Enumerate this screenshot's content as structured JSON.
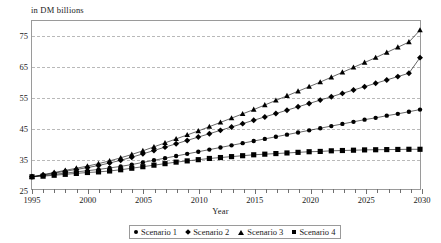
{
  "chart_data": {
    "type": "line",
    "title": "",
    "ylabel": "in DM billions",
    "xlabel": "Year",
    "ylim": [
      25,
      80
    ],
    "xlim": [
      1995,
      2030
    ],
    "yticks": [
      25,
      35,
      45,
      55,
      65,
      75
    ],
    "grid": true,
    "legend_position": "bottom",
    "x": [
      1995,
      1996,
      1997,
      1998,
      1999,
      2000,
      2001,
      2002,
      2003,
      2004,
      2005,
      2006,
      2007,
      2008,
      2009,
      2010,
      2011,
      2012,
      2013,
      2014,
      2015,
      2016,
      2017,
      2018,
      2019,
      2020,
      2021,
      2022,
      2023,
      2024,
      2025,
      2026,
      2027,
      2028,
      2029,
      2030
    ],
    "xtick_labels": [
      "1995",
      "2000",
      "2005",
      "2010",
      "2015",
      "2020",
      "2025",
      "2030"
    ],
    "xtick_label_years": [
      1995,
      2000,
      2005,
      2010,
      2015,
      2020,
      2025,
      2030
    ],
    "series": [
      {
        "name": "Scenario 1",
        "marker": "circle",
        "values": [
          29.0,
          29.4,
          29.8,
          30.2,
          30.6,
          31.0,
          31.4,
          31.9,
          32.4,
          33.0,
          33.7,
          34.4,
          35.1,
          35.8,
          36.5,
          37.2,
          37.9,
          38.6,
          39.3,
          40.0,
          40.7,
          41.4,
          42.1,
          42.8,
          43.5,
          44.2,
          44.9,
          45.6,
          46.3,
          47.0,
          47.7,
          48.3,
          49.0,
          49.6,
          50.3,
          51.0
        ]
      },
      {
        "name": "Scenario 2",
        "marker": "diamond",
        "values": [
          29.0,
          29.6,
          30.2,
          30.8,
          31.4,
          32.0,
          32.7,
          33.5,
          34.4,
          35.4,
          36.5,
          37.6,
          38.7,
          39.8,
          40.9,
          42.0,
          43.1,
          44.2,
          45.3,
          46.4,
          47.5,
          48.6,
          49.7,
          50.8,
          51.9,
          53.0,
          54.1,
          55.2,
          56.3,
          57.4,
          58.5,
          59.6,
          60.7,
          61.8,
          62.9,
          68.0
        ]
      },
      {
        "name": "Scenario 3",
        "marker": "triangle",
        "values": [
          29.0,
          29.7,
          30.4,
          31.1,
          31.8,
          32.5,
          33.3,
          34.2,
          35.2,
          36.3,
          37.5,
          38.8,
          40.1,
          41.4,
          42.7,
          44.0,
          45.4,
          46.8,
          48.2,
          49.6,
          51.0,
          52.5,
          54.0,
          55.5,
          57.0,
          58.5,
          60.0,
          61.6,
          63.2,
          64.8,
          66.4,
          68.0,
          69.7,
          71.4,
          73.1,
          77.0
        ]
      },
      {
        "name": "Scenario 4",
        "marker": "square",
        "values": [
          29.0,
          29.2,
          29.5,
          29.8,
          30.1,
          30.4,
          30.6,
          30.9,
          31.3,
          31.8,
          32.3,
          32.8,
          33.3,
          33.8,
          34.2,
          34.6,
          35.0,
          35.3,
          35.6,
          35.9,
          36.2,
          36.4,
          36.6,
          36.8,
          37.0,
          37.2,
          37.3,
          37.5,
          37.6,
          37.7,
          37.8,
          37.85,
          37.9,
          37.95,
          38.0,
          38.0
        ]
      }
    ]
  }
}
